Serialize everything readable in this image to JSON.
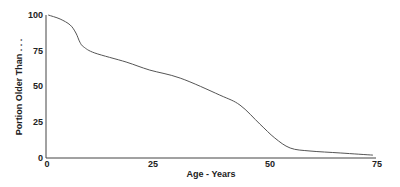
{
  "chart_data": {
    "type": "line",
    "title": "",
    "xlabel": "Age - Years",
    "ylabel": "Portion Older Than . . .",
    "xlim": [
      0,
      75
    ],
    "ylim": [
      0,
      100
    ],
    "xticks": [
      0,
      25,
      50,
      75
    ],
    "yticks": [
      0,
      25,
      50,
      75,
      100
    ],
    "grid": false,
    "legend": null,
    "series": [
      {
        "name": "Survival",
        "color": "#555555",
        "x": [
          0.5,
          3.2,
          5.5,
          6.8,
          7.7,
          8.6,
          11.1,
          18.2,
          23.6,
          30.5,
          39.5,
          44.1,
          48.6,
          52.0,
          55.5,
          60.0,
          67.0,
          74.3
        ],
        "y": [
          100,
          97.2,
          93,
          87.4,
          81,
          77.6,
          73.4,
          67.1,
          61.5,
          55.9,
          44,
          37,
          23.8,
          14,
          7,
          4.9,
          3.5,
          2
        ]
      }
    ]
  },
  "axes": {
    "x_label": "Age - Years",
    "y_label": "Portion Older Than . . .",
    "x_ticks": [
      "0",
      "25",
      "50",
      "75"
    ],
    "y_ticks": [
      "100",
      "75",
      "50",
      "25",
      "0"
    ]
  }
}
